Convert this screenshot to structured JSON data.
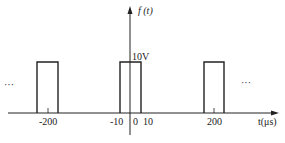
{
  "diagram": {
    "type": "periodic rectangular pulse train",
    "y_axis_label": "f (t)",
    "x_axis_label": "t(μs)",
    "amplitude_label": "10V",
    "ellipsis_left": "···",
    "ellipsis_right": "···",
    "tick_labels": [
      "-200",
      "-10",
      "0",
      "10",
      "200"
    ],
    "pulses": [
      {
        "center": -200,
        "start": -210,
        "end": -190,
        "amplitude": 10
      },
      {
        "center": 0,
        "start": -10,
        "end": 10,
        "amplitude": 10
      },
      {
        "center": 200,
        "start": 190,
        "end": 210,
        "amplitude": 10
      }
    ],
    "period_us": 200,
    "pulse_width_us": 20,
    "line_color": "#222222",
    "background_color": "#ffffff"
  }
}
